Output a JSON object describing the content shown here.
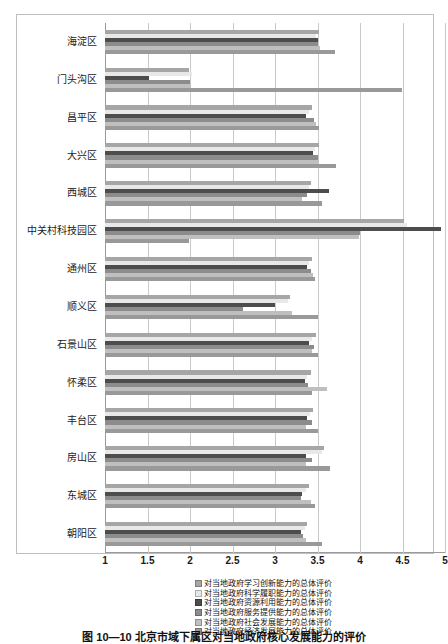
{
  "caption": "图 10—10  北京市域下属区对当地政府核心发展能力的评价",
  "chart_data": {
    "type": "bar",
    "orientation": "horizontal",
    "title": "",
    "xlabel": "",
    "ylabel": "",
    "xlim": [
      1,
      5
    ],
    "xticks": [
      "1",
      "1.5",
      "2",
      "2.5",
      "3",
      "3.5",
      "4",
      "4.5",
      "5"
    ],
    "xtick_values": [
      1,
      1.5,
      2,
      2.5,
      3,
      3.5,
      4,
      4.5,
      5
    ],
    "grid": true,
    "legend_position": "bottom",
    "categories": [
      "海淀区",
      "门头沟区",
      "昌平区",
      "大兴区",
      "西城区",
      "中关村科技园区",
      "通州区",
      "顺义区",
      "石景山区",
      "怀柔区",
      "丰台区",
      "房山区",
      "东城区",
      "朝阳区"
    ],
    "series": [
      {
        "name": "对当地政府学习创新能力的总体评价",
        "color": "#a6a6a6",
        "values": [
          3.52,
          1.99,
          3.43,
          3.52,
          3.42,
          4.52,
          3.44,
          3.18,
          3.48,
          3.42,
          3.45,
          3.58,
          3.4,
          3.38
        ]
      },
      {
        "name": "对当地政府科学履职能力的总体评价",
        "color": "#e8e8e8",
        "values": [
          3.48,
          2.02,
          3.4,
          3.47,
          3.4,
          4.55,
          3.4,
          3.15,
          3.44,
          3.38,
          3.41,
          3.55,
          3.36,
          3.35
        ]
      },
      {
        "name": "对当地政府资源利用能力的总体评价",
        "color": "#4d4d4d",
        "values": [
          3.5,
          1.52,
          3.37,
          3.45,
          3.63,
          4.95,
          3.38,
          3.0,
          3.4,
          3.35,
          3.38,
          3.36,
          3.32,
          3.3
        ]
      },
      {
        "name": "对当地政府服务提供能力的总体评价",
        "color": "#8c8c8c",
        "values": [
          3.51,
          2.0,
          3.46,
          3.5,
          3.38,
          4.0,
          3.42,
          2.62,
          3.46,
          3.39,
          3.43,
          3.44,
          3.3,
          3.33
        ]
      },
      {
        "name": "对当地政府社会发展能力的总体评价",
        "color": "#bfbfbf",
        "values": [
          3.53,
          2.01,
          3.48,
          3.52,
          3.32,
          3.99,
          3.45,
          3.2,
          3.43,
          3.61,
          3.36,
          3.37,
          3.42,
          3.36
        ]
      },
      {
        "name": "对当地政府经济发展能力的总体评价",
        "color": "#999999",
        "values": [
          3.7,
          4.49,
          3.52,
          3.72,
          3.55,
          1.99,
          3.47,
          3.5,
          3.51,
          3.43,
          3.5,
          3.65,
          3.47,
          3.55
        ]
      }
    ]
  }
}
